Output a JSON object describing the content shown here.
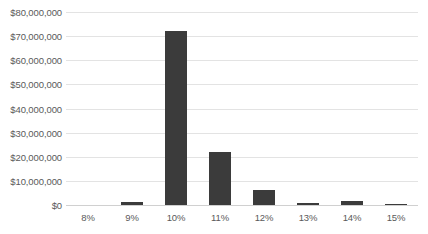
{
  "chart_data": {
    "type": "bar",
    "title": "",
    "xlabel": "",
    "ylabel": "",
    "categories": [
      "8%",
      "9%",
      "10%",
      "11%",
      "12%",
      "13%",
      "14%",
      "15%"
    ],
    "values": [
      0,
      1200000,
      72200000,
      22000000,
      6200000,
      800000,
      1700000,
      400000
    ],
    "ylim": [
      0,
      80000000
    ],
    "y_ticks": [
      0,
      10000000,
      20000000,
      30000000,
      40000000,
      50000000,
      60000000,
      70000000,
      80000000
    ],
    "y_tick_labels": [
      "$0",
      "$10,000,000",
      "$20,000,000",
      "$30,000,000",
      "$40,000,000",
      "$50,000,000",
      "$60,000,000",
      "$70,000,000",
      "$80,000,000"
    ],
    "grid": true,
    "legend": false,
    "legend_position": "none",
    "bar_color": "#3b3b3b",
    "gridline_color": "#e3e3e3",
    "axis_color": "#d0d0d0",
    "tick_label_color": "#5a5a5a",
    "background_color": "#ffffff"
  }
}
